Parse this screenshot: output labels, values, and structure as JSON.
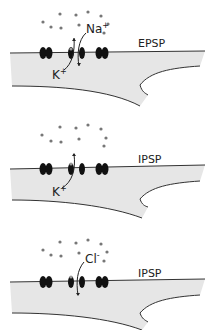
{
  "panels": [
    {
      "label": "EPSP",
      "ions": [
        {
          "text": "Na",
          "sup": "+",
          "direction": "in"
        },
        {
          "text": "K",
          "sup": "+",
          "direction": "out"
        }
      ]
    },
    {
      "label": "IPSP",
      "ions": [
        {
          "text": "K",
          "sup": "+",
          "direction": "out"
        }
      ]
    },
    {
      "label": "IPSP",
      "ions": [
        {
          "text": "Cl",
          "sup": "-",
          "direction": "in"
        }
      ]
    }
  ],
  "colors": {
    "cell": "#e6e6e6",
    "membrane_line": "#333333",
    "channel": "#111111",
    "ion_dot": "#777777",
    "gate_dot": "#999999"
  }
}
